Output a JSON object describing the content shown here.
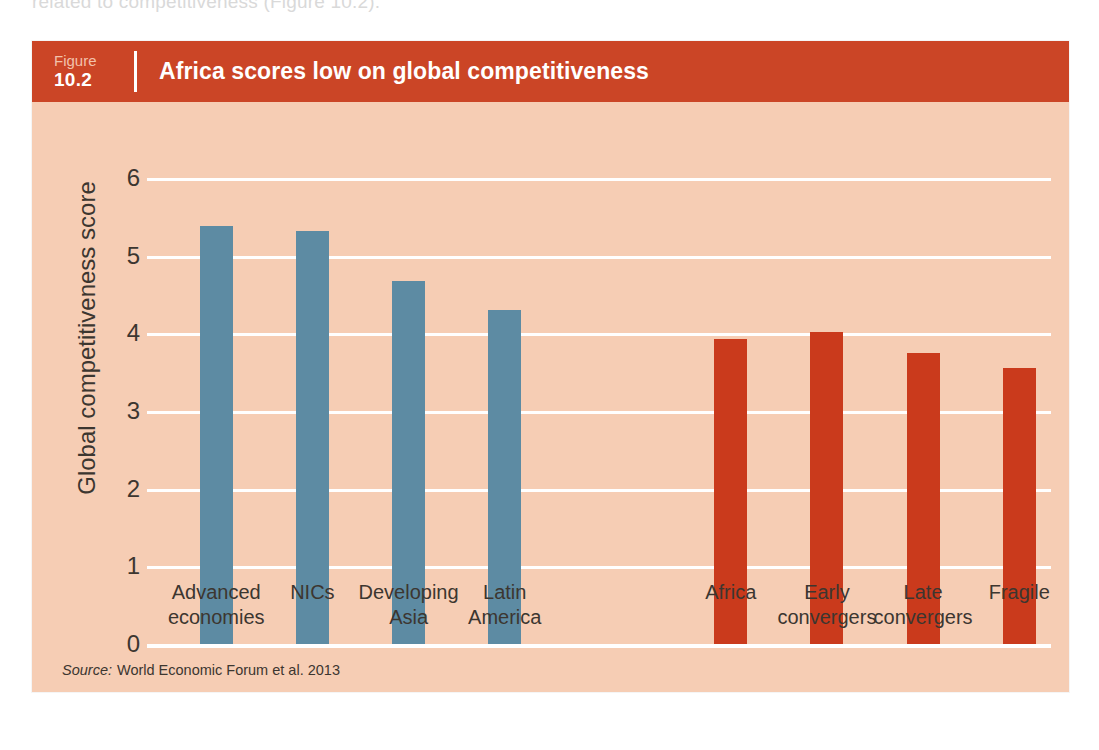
{
  "page": {
    "top_cut_text": "related to competitiveness (Figure 10.2)."
  },
  "figure": {
    "figure_word": "Figure",
    "figure_number": "10.2",
    "title": "Africa scores low on global competitiveness",
    "source_word": "Source:",
    "source_text": "World Economic Forum et al. 2013",
    "colors": {
      "header_red": "#cb4526",
      "panel_background": "#f6cdb4",
      "bar_blue": "#5d8ba3",
      "bar_red": "#ca3a1c",
      "gridline": "#ffffff",
      "text": "#3c3630"
    }
  },
  "chart_data": {
    "type": "bar",
    "title": "Africa scores low on global competitiveness",
    "xlabel": "",
    "ylabel": "Global competitiveness score",
    "ylim": [
      0,
      6
    ],
    "yticks": [
      0,
      1,
      2,
      3,
      4,
      5,
      6
    ],
    "ytick_labels": [
      "0",
      "1",
      "2",
      "3",
      "4",
      "5",
      "6"
    ],
    "grid": true,
    "legend": "none",
    "categories": [
      "Advanced economies",
      "NICs",
      "Developing Asia",
      "Latin America",
      "Africa",
      "Early convergers",
      "Late convergers",
      "Fragile"
    ],
    "category_lines": [
      [
        "Advanced",
        "economies"
      ],
      [
        "NICs",
        ""
      ],
      [
        "Developing",
        "Asia"
      ],
      [
        "Latin",
        "America"
      ],
      [
        "Africa",
        ""
      ],
      [
        "Early",
        "convergers"
      ],
      [
        "Late",
        "convergers"
      ],
      [
        "Fragile",
        ""
      ]
    ],
    "values": [
      5.38,
      5.32,
      4.68,
      4.3,
      3.93,
      4.02,
      3.75,
      3.55
    ],
    "bar_colors": [
      "#5d8ba3",
      "#5d8ba3",
      "#5d8ba3",
      "#5d8ba3",
      "#ca3a1c",
      "#ca3a1c",
      "#ca3a1c",
      "#ca3a1c"
    ],
    "group_gap_after_index": 4
  }
}
